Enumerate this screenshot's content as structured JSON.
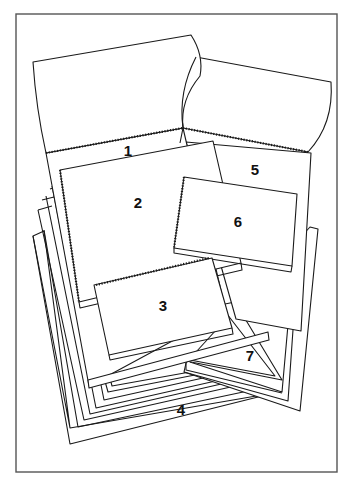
{
  "figure": {
    "type": "line-art illustration",
    "colors": {
      "line": "#1a1a1a",
      "frame": "#555555",
      "background": "#ffffff"
    }
  },
  "labels": [
    {
      "id": "1",
      "text": "1",
      "x": 128,
      "y": 150,
      "item": "large top-bound spiral pad, cover flipped open"
    },
    {
      "id": "2",
      "text": "2",
      "x": 138,
      "y": 202,
      "item": "side-bound spiral notebook"
    },
    {
      "id": "3",
      "text": "3",
      "x": 163,
      "y": 305,
      "item": "top-bound spiral pad"
    },
    {
      "id": "4",
      "text": "4",
      "x": 181,
      "y": 409,
      "item": "stack of loose sheets"
    },
    {
      "id": "5",
      "text": "5",
      "x": 255,
      "y": 169,
      "item": "top-bound spiral pad, cover flipped open"
    },
    {
      "id": "6",
      "text": "6",
      "x": 238,
      "y": 221,
      "item": "small side-bound spiral notebook"
    },
    {
      "id": "7",
      "text": "7",
      "x": 250,
      "y": 355,
      "item": "stack of sheets / pad"
    }
  ]
}
